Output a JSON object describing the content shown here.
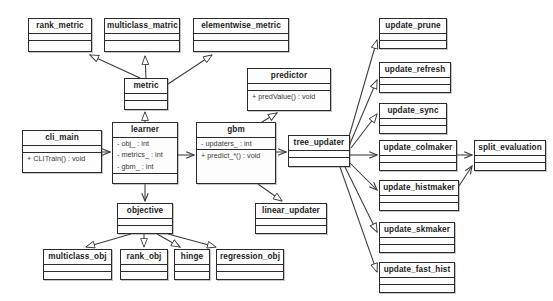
{
  "diagram": {
    "type": "uml-class-diagram",
    "background_color": "#ffffff",
    "line_color": "#3a3a3a",
    "box_border_color": "#2b2b2b",
    "box_fill_color": "#fdfdfd"
  },
  "classes": [
    {
      "id": "rank_metric",
      "name": "rank_metric",
      "attributes": [],
      "operations": [],
      "x": 28,
      "y": 18,
      "w": 64,
      "h": 34
    },
    {
      "id": "multiclass_matric",
      "name": "multiclass_matric",
      "attributes": [],
      "operations": [],
      "x": 104,
      "y": 18,
      "w": 76,
      "h": 34
    },
    {
      "id": "elementwise_metric",
      "name": "elementwise_metric",
      "attributes": [],
      "operations": [],
      "x": 193,
      "y": 18,
      "w": 96,
      "h": 34
    },
    {
      "id": "metric",
      "name": "metric",
      "attributes": [],
      "operations": [],
      "x": 124,
      "y": 78,
      "w": 44,
      "h": 32
    },
    {
      "id": "predictor",
      "name": "predictor",
      "attributes": [],
      "operations": [
        "+ predValue() : void"
      ],
      "x": 247,
      "y": 68,
      "w": 84,
      "h": 43
    },
    {
      "id": "cli_main",
      "name": "cli_main",
      "attributes": [],
      "operations": [
        "+ CLITrain() : void"
      ],
      "x": 22,
      "y": 130,
      "w": 80,
      "h": 43
    },
    {
      "id": "learner",
      "name": "learner",
      "attributes": [
        "- obj_ : int",
        "- metrics_ : int",
        "- gbm_ : int"
      ],
      "operations": [],
      "x": 112,
      "y": 122,
      "w": 66,
      "h": 62
    },
    {
      "id": "gbm",
      "name": "gbm",
      "attributes": [
        "- updaters_ : int"
      ],
      "operations": [
        "+ predict_*() : void"
      ],
      "x": 196,
      "y": 122,
      "w": 80,
      "h": 62
    },
    {
      "id": "tree_updater",
      "name": "tree_updater",
      "attributes": [],
      "operations": [],
      "x": 288,
      "y": 135,
      "w": 62,
      "h": 32
    },
    {
      "id": "linear_updater",
      "name": "linear_updater",
      "attributes": [],
      "operations": [],
      "x": 255,
      "y": 203,
      "w": 72,
      "h": 31
    },
    {
      "id": "objective",
      "name": "objective",
      "attributes": [],
      "operations": [],
      "x": 117,
      "y": 203,
      "w": 56,
      "h": 31
    },
    {
      "id": "multiclass_obj",
      "name": "multiclass_obj",
      "attributes": [],
      "operations": [],
      "x": 43,
      "y": 249,
      "w": 69,
      "h": 31
    },
    {
      "id": "rank_obj",
      "name": "rank_obj",
      "attributes": [],
      "operations": [],
      "x": 120,
      "y": 249,
      "w": 48,
      "h": 31
    },
    {
      "id": "hinge",
      "name": "hinge",
      "attributes": [],
      "operations": [],
      "x": 174,
      "y": 249,
      "w": 36,
      "h": 31
    },
    {
      "id": "regression_obj",
      "name": "regression_obj",
      "attributes": [],
      "operations": [],
      "x": 216,
      "y": 249,
      "w": 68,
      "h": 31
    },
    {
      "id": "update_prune",
      "name": "update_prune",
      "attributes": [],
      "operations": [],
      "x": 379,
      "y": 18,
      "w": 68,
      "h": 31
    },
    {
      "id": "update_refresh",
      "name": "update_refresh",
      "attributes": [],
      "operations": [],
      "x": 379,
      "y": 62,
      "w": 72,
      "h": 31
    },
    {
      "id": "update_sync",
      "name": "update_sync",
      "attributes": [],
      "operations": [],
      "x": 379,
      "y": 103,
      "w": 68,
      "h": 31
    },
    {
      "id": "update_colmaker",
      "name": "update_colmaker",
      "attributes": [],
      "operations": [],
      "x": 379,
      "y": 140,
      "w": 78,
      "h": 31
    },
    {
      "id": "update_histmaker",
      "name": "update_histmaker",
      "attributes": [],
      "operations": [],
      "x": 379,
      "y": 180,
      "w": 80,
      "h": 31
    },
    {
      "id": "update_skmaker",
      "name": "update_skmaker",
      "attributes": [],
      "operations": [],
      "x": 379,
      "y": 222,
      "w": 76,
      "h": 31
    },
    {
      "id": "update_fast_hist",
      "name": "update_fast_hist",
      "attributes": [],
      "operations": [],
      "x": 379,
      "y": 262,
      "w": 76,
      "h": 31
    },
    {
      "id": "split_evaluation",
      "name": "split_evaluation",
      "attributes": [],
      "operations": [],
      "x": 474,
      "y": 140,
      "w": 72,
      "h": 31
    }
  ],
  "edges": [
    {
      "from": "metric",
      "to": "rank_metric",
      "kind": "generalization",
      "path": "M 140 78 L 90 55",
      "arrow": "hollow"
    },
    {
      "from": "metric",
      "to": "multiclass_matric",
      "kind": "generalization",
      "path": "M 146 78 L 145 56",
      "arrow": "hollow"
    },
    {
      "from": "metric",
      "to": "elementwise_metric",
      "kind": "generalization",
      "path": "M 168 84 L 212 55",
      "arrow": "hollow"
    },
    {
      "from": "learner",
      "to": "metric",
      "kind": "generalization",
      "path": "M 145 122 L 145 112",
      "arrow": "hollow"
    },
    {
      "from": "cli_main",
      "to": "learner",
      "kind": "association",
      "path": "M 102 152 L 110 152",
      "arrow": "open"
    },
    {
      "from": "learner",
      "to": "gbm",
      "kind": "association",
      "path": "M 178 155 L 194 155",
      "arrow": "open"
    },
    {
      "from": "learner",
      "to": "objective",
      "kind": "association",
      "path": "M 145 184 L 145 201",
      "arrow": "open"
    },
    {
      "from": "gbm",
      "to": "predictor",
      "kind": "generalization",
      "path": "M 262 122 L 277 113",
      "arrow": "hollow"
    },
    {
      "from": "gbm",
      "to": "tree_updater",
      "kind": "association",
      "path": "M 276 152 L 286 152",
      "arrow": "open"
    },
    {
      "from": "gbm",
      "to": "linear_updater",
      "kind": "generalization",
      "path": "M 258 184 L 282 201",
      "arrow": "hollow"
    },
    {
      "from": "objective",
      "to": "multiclass_obj",
      "kind": "generalization",
      "path": "M 131 234 L 86 247",
      "arrow": "hollow"
    },
    {
      "from": "objective",
      "to": "rank_obj",
      "kind": "generalization",
      "path": "M 144 234 L 144 247",
      "arrow": "hollow"
    },
    {
      "from": "objective",
      "to": "hinge",
      "kind": "generalization",
      "path": "M 157 234 L 180 247",
      "arrow": "hollow"
    },
    {
      "from": "objective",
      "to": "regression_obj",
      "kind": "generalization",
      "path": "M 168 234 L 216 247",
      "arrow": "hollow"
    },
    {
      "from": "tree_updater",
      "to": "update_prune",
      "kind": "generalization",
      "path": "M 348 140 L 377 40",
      "arrow": "hollow"
    },
    {
      "from": "tree_updater",
      "to": "update_refresh",
      "kind": "generalization",
      "path": "M 349 146 L 377 80",
      "arrow": "hollow"
    },
    {
      "from": "tree_updater",
      "to": "update_sync",
      "kind": "generalization",
      "path": "M 351 148 L 377 114",
      "arrow": "hollow"
    },
    {
      "from": "tree_updater",
      "to": "update_colmaker",
      "kind": "association",
      "path": "M 350 155 L 377 155",
      "arrow": "open"
    },
    {
      "from": "tree_updater",
      "to": "update_histmaker",
      "kind": "association",
      "path": "M 350 163 L 377 190",
      "arrow": "open"
    },
    {
      "from": "tree_updater",
      "to": "update_skmaker",
      "kind": "generalization",
      "path": "M 345 167 L 377 232",
      "arrow": "hollow"
    },
    {
      "from": "tree_updater",
      "to": "update_fast_hist",
      "kind": "generalization",
      "path": "M 340 167 L 377 272",
      "arrow": "hollow"
    },
    {
      "from": "update_colmaker",
      "to": "split_evaluation",
      "kind": "association",
      "path": "M 457 155 L 472 155",
      "arrow": "open"
    },
    {
      "from": "update_histmaker",
      "to": "split_evaluation",
      "kind": "association",
      "path": "M 459 186 L 472 166",
      "arrow": "open"
    }
  ]
}
